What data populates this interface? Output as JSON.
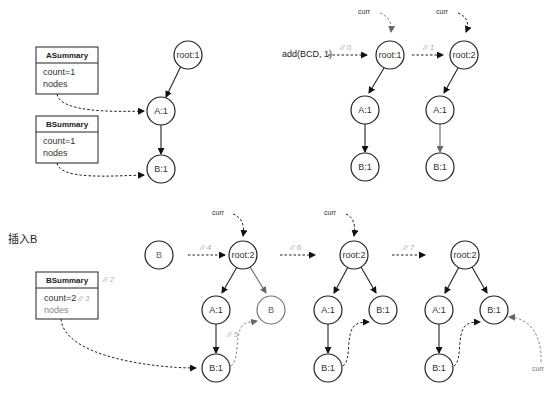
{
  "top_left": {
    "asummary": {
      "title": "ASummary",
      "count": "count=1",
      "nodes": "nodes"
    },
    "bsummary": {
      "title": "BSummary",
      "count": "count=1",
      "nodes": "nodes"
    },
    "tree": {
      "root": "root:1",
      "a": "A:1",
      "b": "B:1"
    }
  },
  "top_right": {
    "call": "add(BCD, 1)",
    "step0": "// 0",
    "step1": "// 1",
    "curr1": "curr",
    "curr2": "curr",
    "tree1": {
      "root": "root:1",
      "a": "A:1",
      "b": "B:1"
    },
    "tree2": {
      "root": "root:2",
      "a": "A:1",
      "b": "B:1"
    }
  },
  "bottom": {
    "heading": "插入B",
    "bsummary": {
      "title": "BSummary",
      "count_prefix": "count=2",
      "count_comment": "// 3",
      "nodes": "nodes",
      "comment": "// 2"
    },
    "new_node": "B",
    "step4": "// 4",
    "step5": "// 5",
    "step6": "// 6",
    "step7": "// 7",
    "curr_a": "curr",
    "curr_b": "curr",
    "curr_c": "curr",
    "tree_a": {
      "root": "root:2",
      "a": "A:1",
      "b": "B:1",
      "new_b": "B"
    },
    "tree_b": {
      "root": "root:2",
      "a": "A:1",
      "b": "B:1",
      "new_b": "B:1"
    },
    "tree_c": {
      "root": "root:2",
      "a": "A:1",
      "b": "B:1",
      "new_b": "B:1"
    }
  },
  "colors": {
    "stroke": "#222222",
    "gray_stroke": "#777777",
    "step_comment": "#aaaaaa"
  }
}
